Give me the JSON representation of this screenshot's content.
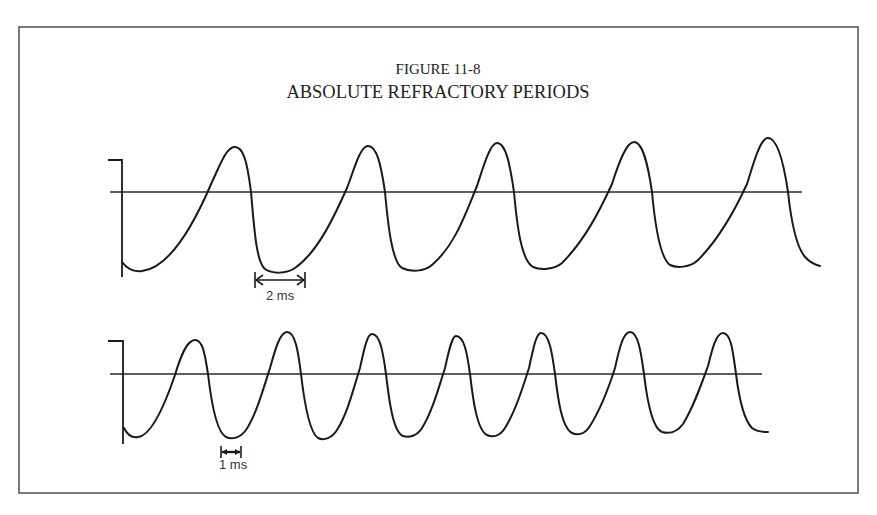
{
  "figure": {
    "number_label": "FIGURE 11-8",
    "title": "ABSOLUTE REFRACTORY PERIODS",
    "frame": {
      "x": 19,
      "y": 27,
      "width": 839,
      "height": 466,
      "color": "#5a5a5a"
    }
  },
  "traces": [
    {
      "id": "upper",
      "description": "Action potentials with long (2 ms) absolute refractory period",
      "baseline": {
        "x1": 110,
        "x2": 802,
        "y": 192
      },
      "stem": "M108 160 L122 160 L122 277",
      "path": "M122 262 C128 270 135 272 142 271 C170 268 195 222 212 182 C220 165 226 148 234 147 C243 146 247 160 251 192 C254 225 256 262 265 269 C272 274 286 274 295 268 C318 252 335 215 347 188 C354 170 360 146 368 146 C377 146 381 165 385 192 C388 225 392 262 402 268 C410 272 424 272 432 265 C455 245 465 215 477 186 C483 168 490 143 497 143 C506 143 510 165 514 192 C517 225 521 260 533 267 C540 270 554 270 562 263 C585 240 600 210 612 184 C618 165 626 142 634 142 C643 142 648 165 652 192 C655 225 660 258 670 265 C676 268 690 268 698 260 C720 238 735 210 747 184 C753 165 760 138 768 138 C778 138 784 165 788 192 C791 220 796 248 806 258 C811 263 816 265 820 266",
      "scale_marker": {
        "label": "2 ms",
        "x1": 255,
        "x2": 305,
        "y": 280,
        "label_x": 266,
        "label_y": 300
      }
    },
    {
      "id": "lower",
      "description": "Action potentials with short (1 ms) absolute refractory period",
      "baseline": {
        "x1": 110,
        "x2": 762,
        "y": 374
      },
      "stem": "M108 341 L123 341 L123 444",
      "path": "M124 428 C128 436 133 438 138 437 C150 436 163 410 175 375 C181 355 187 340 195 340 C203 340 205 355 208 374 C211 400 216 432 226 437 C232 440 240 438 246 430 C256 415 263 390 270 368 C275 350 280 332 287 332 C295 332 298 350 301 374 C304 400 309 432 318 438 C324 441 332 438 337 430 C347 415 353 390 360 368 C364 350 367 334 372 334 C380 334 383 352 386 374 C389 400 393 432 403 436 C409 438 417 436 422 428 C432 412 438 390 445 368 C449 350 452 336 456 336 C464 336 467 352 470 374 C473 400 477 430 487 435 C493 438 500 436 505 428 C515 412 522 390 529 368 C533 350 536 333 541 333 C549 333 552 352 555 374 C558 400 562 428 572 433 C578 436 585 434 590 426 C600 410 608 390 615 368 C619 350 623 332 630 332 C638 332 641 352 644 374 C647 400 652 428 662 432 C669 434 677 432 683 424 C693 408 700 388 708 366 C712 350 716 333 723 333 C731 333 733 352 736 374 C739 398 744 420 752 428 C757 432 763 432 768 432",
      "scale_marker": {
        "label": "1 ms",
        "x1": 221,
        "x2": 241,
        "y": 452,
        "label_x": 219,
        "label_y": 469
      }
    }
  ]
}
